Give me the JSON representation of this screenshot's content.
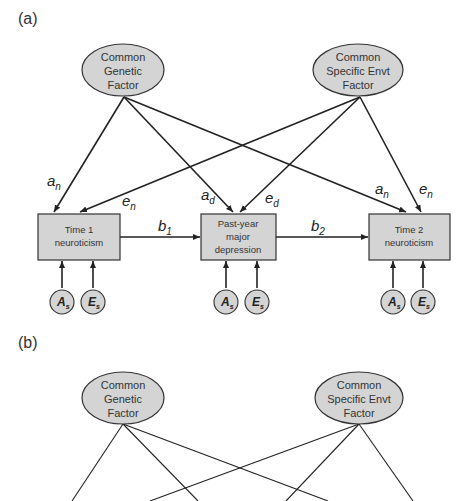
{
  "panels": [
    {
      "label": "(a)",
      "factors": {
        "genetic": [
          "Common",
          "Genetic",
          "Factor"
        ],
        "environment": [
          "Common",
          "Specific Envt",
          "Factor"
        ]
      },
      "boxes": {
        "time1": [
          "Time 1",
          "neuroticism"
        ],
        "depression": [
          "Past-year",
          "major",
          "depression"
        ],
        "time2": [
          "Time 2",
          "neuroticism"
        ]
      },
      "paths": {
        "an_left": {
          "main": "a",
          "sub": "n"
        },
        "en_left": {
          "main": "e",
          "sub": "n"
        },
        "ad": {
          "main": "a",
          "sub": "d"
        },
        "ed": {
          "main": "e",
          "sub": "d"
        },
        "an_right": {
          "main": "a",
          "sub": "n"
        },
        "en_right": {
          "main": "e",
          "sub": "n"
        },
        "b1": {
          "main": "b",
          "sub": "1"
        },
        "b2": {
          "main": "b",
          "sub": "2"
        }
      },
      "residuals": {
        "a": {
          "main": "A",
          "sub": "s"
        },
        "e": {
          "main": "E",
          "sub": "s"
        }
      }
    },
    {
      "label": "(b)",
      "factors": {
        "genetic": [
          "Common",
          "Genetic",
          "Factor"
        ],
        "environment": [
          "Common",
          "Specific Envt",
          "Factor"
        ]
      }
    }
  ],
  "colors": {
    "node_fill": "#d4d4d4",
    "stroke": "#333333"
  }
}
